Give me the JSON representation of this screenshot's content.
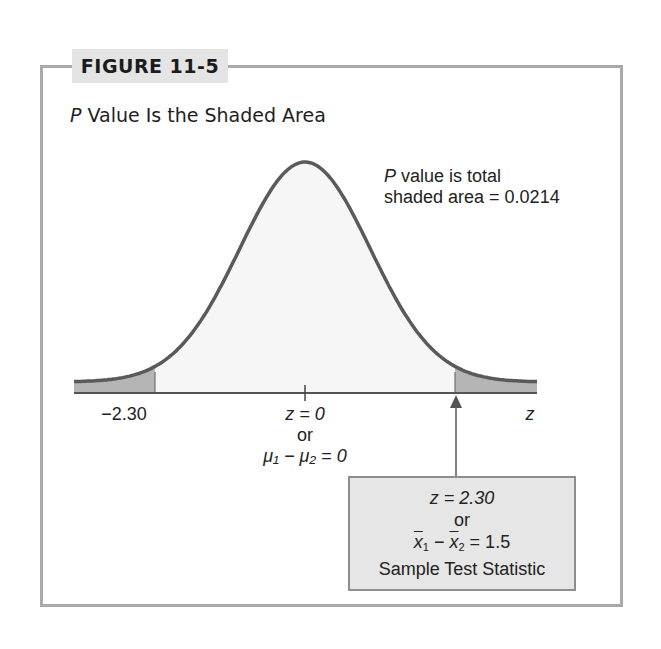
{
  "figure": {
    "label": "FIGURE 11-5",
    "title_italic": "P",
    "title_rest": " Value Is the Shaded Area"
  },
  "annotation": {
    "line1_italic": "P",
    "line1_rest": " value is total",
    "line2": "shaded area = 0.0214"
  },
  "axis": {
    "left_tick_label": "−2.30",
    "center_label_line1": "z = 0",
    "center_label_line2": "or",
    "center_label_line3": "μ₁ − μ₂ = 0",
    "axis_variable": "z"
  },
  "stat_box": {
    "line1": "z = 2.30",
    "line2": "or",
    "line3_a": "x",
    "line3_sub1": "1",
    "line3_mid": " − ",
    "line3_b": "x",
    "line3_sub2": "2",
    "line3_end": " = 1.5",
    "line4": "Sample Test Statistic"
  },
  "colors": {
    "frame": "#a9a9a9",
    "label_bg": "#e4e4e4",
    "curve": "#5a5a5a",
    "body_fill": "#f6f6f6",
    "tail_fill": "#b5b5b5",
    "statbox_bg": "#e6e6e6"
  },
  "chart_data": {
    "type": "area",
    "title": "P Value Is the Shaded Area",
    "distribution": "standard normal",
    "xlabel": "z",
    "ylabel": "",
    "xlim": [
      -3.5,
      3.5
    ],
    "center": 0,
    "critical_values": [
      -2.3,
      2.3
    ],
    "shaded_regions": [
      {
        "from": -3.5,
        "to": -2.3,
        "label": "left tail"
      },
      {
        "from": 2.3,
        "to": 3.5,
        "label": "right tail"
      }
    ],
    "tick_labels": [
      "−2.30",
      "z = 0",
      "z"
    ],
    "annotations": [
      "P value is total shaded area = 0.0214",
      "z = 0 or μ1 − μ2 = 0",
      "z = 2.30 or x̄1 − x̄2 = 1.5 Sample Test Statistic"
    ],
    "p_value": 0.0214,
    "test_statistic_z": 2.3,
    "difference_of_means": 1.5,
    "grid": false,
    "legend": "none"
  }
}
